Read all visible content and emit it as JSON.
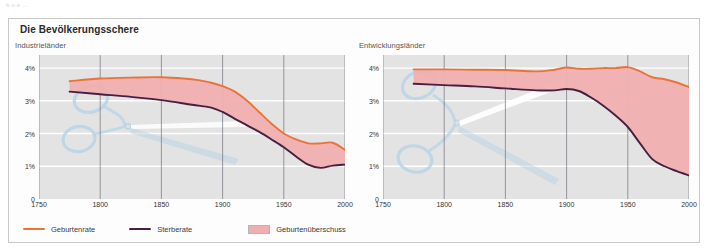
{
  "top_caption": "b  u  e  ...",
  "panel": {
    "title": "Die Bevölkerungsschere",
    "border_color": "#c8c8c8"
  },
  "colors": {
    "birth_rate": "#E8743B",
    "death_rate": "#472040",
    "surplus_fill": "#F0AFAF",
    "plot_background": "#e3e3e3",
    "gridline": "#ffffff",
    "axis": "#6e6e78",
    "watermark": "#b9d4e6"
  },
  "legend": {
    "items": [
      {
        "label": "Geburtenrate",
        "type": "line",
        "color": "#E8743B"
      },
      {
        "label": "Sterberate",
        "type": "line",
        "color": "#472040"
      },
      {
        "label": "Geburtenüberschuss",
        "type": "area",
        "color": "#F0AFAF"
      }
    ]
  },
  "chart_data": [
    {
      "type": "area",
      "title": "Die Bevölkerungsschere",
      "subtitle": "Industrieländer",
      "xlabel": "",
      "ylabel": "",
      "xlim": [
        1750,
        2000
      ],
      "ylim": [
        0,
        4.4
      ],
      "xticks": [
        1750,
        1800,
        1850,
        1900,
        1950,
        2000
      ],
      "yticks": [
        0,
        1,
        2,
        3,
        4
      ],
      "ytick_labels": [
        "0",
        "1%",
        "2%",
        "3%",
        "4%"
      ],
      "xtick_labels": [
        "1750",
        "1800",
        "1850",
        "1900",
        "1950",
        "2000"
      ],
      "grid": true,
      "legend_position": "bottom",
      "x": [
        1775,
        1800,
        1825,
        1850,
        1875,
        1890,
        1900,
        1910,
        1920,
        1930,
        1940,
        1950,
        1960,
        1970,
        1980,
        1990,
        2000
      ],
      "series": [
        {
          "name": "Geburtenrate",
          "color": "#E8743B",
          "values": [
            3.6,
            3.68,
            3.71,
            3.72,
            3.66,
            3.56,
            3.45,
            3.28,
            3.0,
            2.65,
            2.3,
            2.0,
            1.82,
            1.7,
            1.7,
            1.72,
            1.5
          ]
        },
        {
          "name": "Sterberate",
          "color": "#472040",
          "values": [
            3.28,
            3.2,
            3.12,
            3.02,
            2.88,
            2.8,
            2.66,
            2.45,
            2.25,
            2.05,
            1.82,
            1.58,
            1.3,
            1.05,
            0.95,
            1.02,
            1.05
          ]
        }
      ],
      "fill_between": {
        "name": "Geburtenüberschuss",
        "upper": "Geburtenrate",
        "lower": "Sterberate",
        "color": "#F0AFAF"
      }
    },
    {
      "type": "area",
      "title": "Die Bevölkerungsschere",
      "subtitle": "Entwicklungsländer",
      "xlabel": "",
      "ylabel": "",
      "xlim": [
        1750,
        2000
      ],
      "ylim": [
        0,
        4.4
      ],
      "xticks": [
        1750,
        1800,
        1850,
        1900,
        1950,
        2000
      ],
      "yticks": [
        0,
        1,
        2,
        3,
        4
      ],
      "ytick_labels": [
        "0",
        "1%",
        "2%",
        "3%",
        "4%"
      ],
      "xtick_labels": [
        "1750",
        "1800",
        "1850",
        "1900",
        "1950",
        "2000"
      ],
      "grid": true,
      "legend_position": "bottom",
      "x": [
        1775,
        1800,
        1825,
        1850,
        1875,
        1890,
        1900,
        1910,
        1920,
        1930,
        1940,
        1950,
        1960,
        1970,
        1980,
        1990,
        2000
      ],
      "series": [
        {
          "name": "Geburtenrate",
          "color": "#E8743B",
          "values": [
            3.96,
            3.96,
            3.95,
            3.94,
            3.9,
            3.95,
            4.02,
            3.98,
            3.98,
            4.0,
            4.0,
            4.03,
            3.9,
            3.72,
            3.66,
            3.56,
            3.42
          ]
        },
        {
          "name": "Sterberate",
          "color": "#472040",
          "values": [
            3.52,
            3.48,
            3.44,
            3.38,
            3.32,
            3.32,
            3.36,
            3.3,
            3.1,
            2.85,
            2.55,
            2.2,
            1.7,
            1.22,
            1.0,
            0.85,
            0.72
          ]
        }
      ],
      "fill_between": {
        "name": "Geburtenüberschuss",
        "upper": "Geburtenrate",
        "lower": "Sterberate",
        "color": "#F0AFAF"
      }
    }
  ]
}
